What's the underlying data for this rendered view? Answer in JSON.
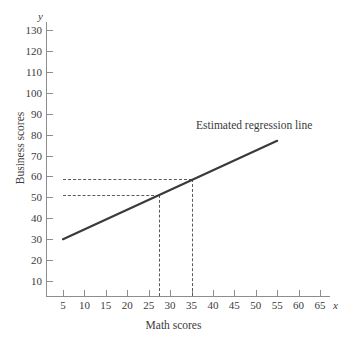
{
  "chart_data": {
    "type": "line",
    "title": "",
    "xlabel": "Math scores",
    "ylabel": "Business scores",
    "x_var": "x",
    "y_var": "y",
    "xlim": [
      0,
      68
    ],
    "ylim": [
      0,
      136
    ],
    "xticks": [
      5,
      10,
      15,
      20,
      25,
      30,
      35,
      40,
      45,
      50,
      55,
      60,
      65
    ],
    "yticks": [
      10,
      20,
      30,
      40,
      50,
      60,
      70,
      80,
      90,
      100,
      110,
      120,
      130
    ],
    "grid": false,
    "legend_position": "none",
    "series": [
      {
        "name": "Estimated regression line",
        "type": "line",
        "color": "#3a3a3a",
        "points": [
          {
            "x": 5,
            "y": 30
          },
          {
            "x": 55,
            "y": 77
          }
        ]
      }
    ],
    "annotations": [
      {
        "name": "regression-line-label",
        "text": "Estimated regression line",
        "x": 38,
        "y": 86
      }
    ],
    "guides": [
      {
        "name": "guide-horizontal-lower",
        "orientation": "horizontal",
        "y": 51,
        "from_x": 5,
        "to_x": 27.5
      },
      {
        "name": "guide-vertical-lower",
        "orientation": "vertical",
        "x": 27.5,
        "from_y": 0,
        "to_y": 51
      },
      {
        "name": "guide-horizontal-upper",
        "orientation": "horizontal",
        "y": 59,
        "from_x": 5,
        "to_x": 35
      },
      {
        "name": "guide-vertical-upper",
        "orientation": "vertical",
        "x": 35,
        "from_y": 0,
        "to_y": 59
      }
    ],
    "colors": {
      "line": "#3a3a3a",
      "axis": "#8d8d8d",
      "guide": "#5a5a5a",
      "text": "#3b3b3b",
      "background": "#ffffff"
    }
  }
}
